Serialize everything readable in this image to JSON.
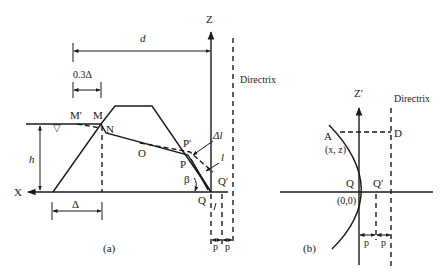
{
  "panel_a": {
    "caption": "(a)",
    "axis_x_label": "X",
    "axis_z_label": "Z",
    "directrix_label": "Directrix",
    "dim_d": "d",
    "dim_03delta": "0.3Δ",
    "dim_delta": "Δ",
    "dim_h": "h",
    "water_symbol": "▽",
    "points": {
      "M_prime": "M'",
      "M": "M",
      "N": "N",
      "O": "O",
      "P_prime": "P'",
      "P": "P",
      "Q": "Q",
      "Q_prime": "Q'"
    },
    "angle_beta": "β",
    "delta_l": "Δl",
    "l": "l",
    "p_left": "p",
    "p_right": "p"
  },
  "panel_b": {
    "caption": "(b)",
    "axis_z_label": "Z'",
    "directrix_label": "Directrix",
    "point_A": "A",
    "point_A_coords": "(x, z)",
    "point_D": "D",
    "point_Q": "Q",
    "point_Q_prime": "Q'",
    "origin": "(0,0)",
    "p_left": "p",
    "p_right": "p"
  },
  "colors": {
    "line": "#1a1a1a",
    "background": "#ffffff"
  }
}
